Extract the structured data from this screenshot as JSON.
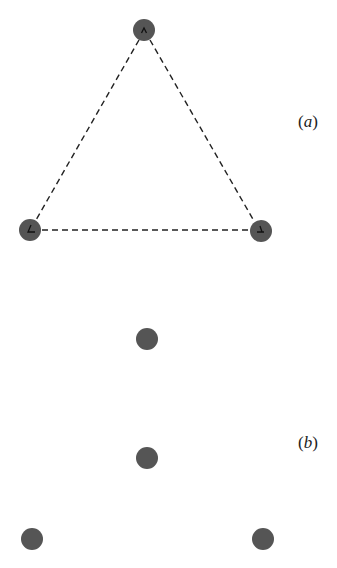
{
  "panels": [
    {
      "label": "(a)",
      "label_letter": "a",
      "nodes": [
        {
          "id": "top",
          "x": 144,
          "y": 30,
          "mark": "wedge-up"
        },
        {
          "id": "bottom-left",
          "x": 30,
          "y": 230,
          "mark": "angle-left"
        },
        {
          "id": "bottom-right",
          "x": 261,
          "y": 231,
          "mark": "angle-right"
        }
      ],
      "edges": [
        {
          "from": "top",
          "to": "bottom-left",
          "style": "dashed"
        },
        {
          "from": "top",
          "to": "bottom-right",
          "style": "dashed"
        },
        {
          "from": "bottom-left",
          "to": "bottom-right",
          "style": "dashed"
        }
      ]
    },
    {
      "label": "(b)",
      "label_letter": "b",
      "nodes": [
        {
          "id": "center-upper",
          "x": 147,
          "y": 339
        },
        {
          "id": "center-lower",
          "x": 147,
          "y": 458
        },
        {
          "id": "bottom-left",
          "x": 32,
          "y": 539
        },
        {
          "id": "bottom-right",
          "x": 263,
          "y": 539
        }
      ],
      "edges": []
    }
  ],
  "colors": {
    "node_fill": "#555555",
    "edge": "#222222",
    "mark": "#111111"
  }
}
